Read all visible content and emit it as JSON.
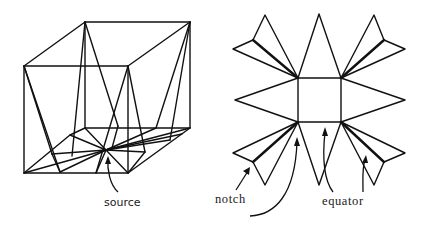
{
  "figure": {
    "left_panel": {
      "title": "cube with shortest paths from source",
      "labels": {
        "source": "source"
      }
    },
    "right_panel": {
      "title": "star unfolding of cube",
      "labels": {
        "notch": "notch",
        "equator": "equator"
      }
    }
  }
}
